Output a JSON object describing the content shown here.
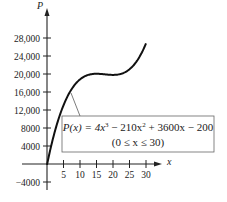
{
  "chart_data": {
    "type": "line",
    "title": "",
    "xlabel": "x",
    "ylabel": "P",
    "xlim": [
      0,
      30
    ],
    "ylim": [
      -4000,
      28000
    ],
    "grid": false,
    "legend": null,
    "x_ticks": [
      5,
      10,
      15,
      20,
      25,
      30
    ],
    "x_tick_labels": [
      "5",
      "10",
      "15",
      "20",
      "25",
      "30"
    ],
    "y_ticks": [
      -4000,
      4000,
      8000,
      12000,
      16000,
      20000,
      24000,
      28000
    ],
    "y_tick_labels": [
      "−4000",
      "4000",
      "8000",
      "12,000",
      "16,000",
      "20,000",
      "24,000",
      "28,000"
    ],
    "series": [
      {
        "name": "P(x) = 4x^3 − 210x^2 + 3600x − 200",
        "x": [
          0,
          2.5,
          5,
          7.5,
          10,
          12.5,
          15,
          17.5,
          20,
          22.5,
          25,
          27.5,
          30
        ],
        "values": [
          -200,
          7550,
          13050,
          16675,
          18800,
          19800,
          20050,
          19925,
          19800,
          20050,
          21050,
          23175,
          26800
        ]
      }
    ],
    "annotations": [
      {
        "line1_prefix": "P(x) = 4x",
        "line1_exp1": "3",
        "line1_mid": " − 210x",
        "line1_exp2": "2",
        "line1_suffix": " + 3600x − 200",
        "line2": "(0 ≤ x ≤ 30)"
      }
    ]
  }
}
